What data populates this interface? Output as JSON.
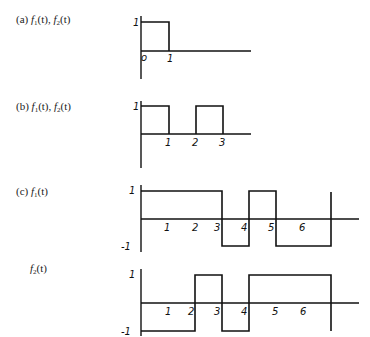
{
  "panels": [
    {
      "id": "a",
      "label_prefix": "(a)",
      "label_funcs": [
        "f",
        "1",
        "(t), ",
        "f",
        "2",
        "(t)"
      ],
      "y_tick": "1",
      "x_ticks": [
        "o",
        "1"
      ]
    },
    {
      "id": "b",
      "label_prefix": "(b)",
      "label_funcs": [
        "f",
        "1",
        "(t), ",
        "f",
        "2",
        "(t)"
      ],
      "y_tick": "1",
      "x_ticks": [
        "1",
        "2",
        "3"
      ]
    },
    {
      "id": "c",
      "label_prefix": "(c)",
      "label_funcs": [
        "f",
        "1",
        "(t)"
      ],
      "y_ticks": [
        "1",
        "-1"
      ],
      "x_ticks": [
        "1",
        "2",
        "3",
        "4",
        "5",
        "6"
      ]
    },
    {
      "id": "c2",
      "label_prefix": "",
      "label_funcs": [
        "f",
        "2",
        "(t)"
      ],
      "y_ticks": [
        "1",
        "-1"
      ],
      "x_ticks": [
        "1",
        "2",
        "3",
        "4",
        "5",
        "6"
      ]
    }
  ],
  "signals": {
    "a": {
      "segments": [
        [
          0,
          1,
          1
        ],
        [
          1,
          4,
          0
        ]
      ]
    },
    "b": {
      "segments": [
        [
          0,
          1,
          1
        ],
        [
          1,
          2,
          0
        ],
        [
          2,
          3,
          1
        ]
      ]
    },
    "c_f1": {
      "segments": [
        [
          0,
          3,
          1
        ],
        [
          3,
          4,
          -1
        ],
        [
          4,
          5,
          1
        ],
        [
          5,
          7,
          -1
        ]
      ]
    },
    "c_f2": {
      "segments": [
        [
          0,
          2,
          -1
        ],
        [
          2,
          3,
          1
        ],
        [
          3,
          4,
          -1
        ],
        [
          4,
          7,
          1
        ]
      ]
    }
  }
}
